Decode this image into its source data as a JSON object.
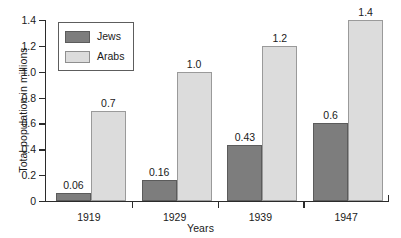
{
  "chart_data": {
    "type": "bar",
    "title": "",
    "xlabel": "Years",
    "ylabel": "Total population in millions",
    "categories": [
      "1919",
      "1929",
      "1939",
      "1947"
    ],
    "series": [
      {
        "name": "Jews",
        "values": [
          0.06,
          0.16,
          0.43,
          0.6
        ],
        "labels": [
          "0.06",
          "0.16",
          "0.43",
          "0.6"
        ],
        "color": "#7d7d7d"
      },
      {
        "name": "Arabs",
        "values": [
          0.7,
          1.0,
          1.2,
          1.4
        ],
        "labels": [
          "0.7",
          "1.0",
          "1.2",
          "1.4"
        ],
        "color": "#dcdcdc"
      }
    ],
    "ylim": [
      0,
      1.4
    ],
    "yticks": [
      0,
      0.2,
      0.4,
      0.6,
      0.8,
      1.0,
      1.2,
      1.4
    ],
    "ytick_labels": [
      "0",
      "0.2",
      "0.4",
      "0.6",
      "0.8",
      "1.0",
      "1.2",
      "1.4"
    ],
    "grid": false,
    "legend_position": "top-left"
  },
  "legend": {
    "entries": [
      {
        "label": "Jews",
        "swatch": "dark-gray-swatch"
      },
      {
        "label": "Arabs",
        "swatch": "light-gray-swatch"
      }
    ]
  }
}
